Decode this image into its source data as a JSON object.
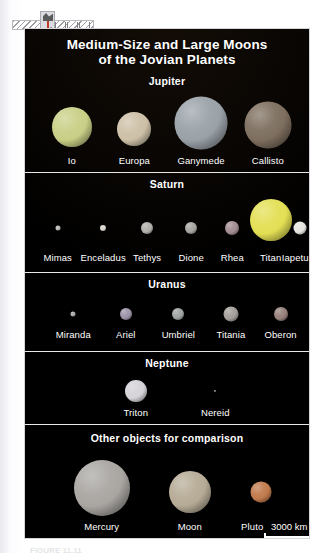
{
  "figure": {
    "title_line1": "Medium-Size and Large Moons",
    "title_line2": "of the Jovian Planets",
    "caption": "FIGURE 11.11"
  },
  "panels": [
    {
      "id": "jupiter",
      "heading": "Jupiter",
      "moons": [
        {
          "name": "Io",
          "cx": 16.5,
          "d": 40,
          "color": "#c9cf86"
        },
        {
          "name": "Europa",
          "cx": 38.5,
          "d": 34,
          "color": "#cdc0a7"
        },
        {
          "name": "Ganymede",
          "cx": 62.0,
          "d": 53,
          "color": "#9aa2a8"
        },
        {
          "name": "Callisto",
          "cx": 85.5,
          "d": 47,
          "color": "#7d6e5e"
        }
      ]
    },
    {
      "id": "saturn",
      "heading": "Saturn",
      "moons": [
        {
          "name": "Mimas",
          "cx": 11.5,
          "d": 5,
          "color": "#b9b9b4"
        },
        {
          "name": "Enceladus",
          "cx": 27.5,
          "d": 6,
          "color": "#d8d4cb"
        },
        {
          "name": "Tethys",
          "cx": 43.0,
          "d": 12,
          "color": "#b1b0ab"
        },
        {
          "name": "Dione",
          "cx": 58.5,
          "d": 12,
          "color": "#a6a5a0"
        },
        {
          "name": "Rhea",
          "cx": 73.0,
          "d": 14,
          "color": "#a28d92"
        },
        {
          "name": "Titan",
          "cx": 86.5,
          "d": 42,
          "color": "#e3df54"
        },
        {
          "name": "Iapetus",
          "cx": 97.0,
          "d": 13,
          "color": "#e6e4de"
        }
      ]
    },
    {
      "id": "uranus",
      "heading": "Uranus",
      "moons": [
        {
          "name": "Miranda",
          "cx": 17.0,
          "d": 5,
          "color": "#a9a8a6"
        },
        {
          "name": "Ariel",
          "cx": 35.5,
          "d": 12,
          "color": "#9e93a8"
        },
        {
          "name": "Umbriel",
          "cx": 54.0,
          "d": 12,
          "color": "#9fa4a3"
        },
        {
          "name": "Titania",
          "cx": 72.5,
          "d": 15,
          "color": "#a49e99"
        },
        {
          "name": "Oberon",
          "cx": 90.0,
          "d": 14,
          "color": "#96817b"
        }
      ]
    },
    {
      "id": "neptune",
      "heading": "Neptune",
      "moons": [
        {
          "name": "Triton",
          "cx": 39.0,
          "d": 22,
          "color": "#d5d2d8"
        },
        {
          "name": "Nereid",
          "cx": 67.0,
          "d": 2,
          "color": "#8d8d8d"
        }
      ]
    },
    {
      "id": "other",
      "heading": "Other objects for comparison",
      "moons": [
        {
          "name": "Mercury",
          "cx": 27.0,
          "d": 56,
          "color": "#a9a6a2"
        },
        {
          "name": "Moon",
          "cx": 58.0,
          "d": 42,
          "color": "#b6ab96"
        },
        {
          "name": "Pluto",
          "cx": 83.0,
          "d": 21,
          "color": "#c07a4c"
        }
      ]
    }
  ],
  "scalebar": {
    "label": "3000 km"
  }
}
